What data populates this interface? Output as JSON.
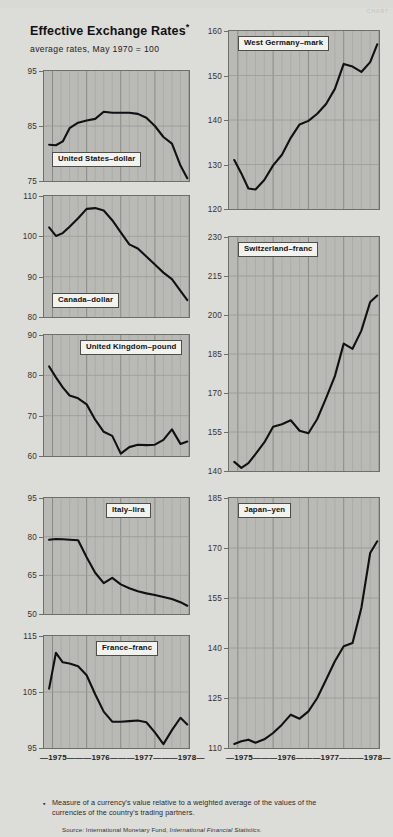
{
  "header": {
    "title": "Effective Exchange Rates",
    "title_asterisk": "*",
    "subtitle": "average rates, May 1970 = 100",
    "watermark": "CHART"
  },
  "footnote": {
    "marker": "▪",
    "text": "Measure of a currency's value relative to a weighted average of the values of the currencies of the country's trading partners.",
    "source_prefix": "Source: International Monetary Fund, ",
    "source_italic": "International Financial Statistics."
  },
  "axis": {
    "x_ticks": [
      "1975",
      "1976",
      "1977",
      "1978"
    ],
    "x_label_row": "—1975———1976———1977———1978—"
  },
  "chart_data": {
    "type": "line",
    "title": "Effective Exchange Rates*",
    "subtitle": "average rates, May 1970 = 100",
    "xlabel": "",
    "ylabel": "Index (May 1970 = 100)",
    "grid": true,
    "legend": "inline panel labels",
    "xlim": [
      1974.75,
      1979.0
    ],
    "x_tick_labels": [
      "1975",
      "1976",
      "1977",
      "1978"
    ],
    "note": "Each panel is a separate currency index; x axis spans 1975 through 1978 with quarterly gridlines.",
    "panels": [
      {
        "name": "United States–dollar",
        "label": "United States–dollar",
        "ylim": [
          75,
          95
        ],
        "yticks": [
          75,
          85,
          95
        ],
        "x": [
          1974.9,
          1975.1,
          1975.3,
          1975.5,
          1975.75,
          1976.0,
          1976.25,
          1976.5,
          1976.75,
          1977.0,
          1977.25,
          1977.5,
          1977.75,
          1978.0,
          1978.25,
          1978.5,
          1978.75,
          1978.95
        ],
        "values": [
          81.6,
          81.5,
          82.2,
          84.6,
          85.6,
          86.0,
          86.3,
          87.6,
          87.4,
          87.4,
          87.4,
          87.2,
          86.5,
          85.0,
          83.0,
          81.8,
          77.8,
          75.5
        ]
      },
      {
        "name": "Canada–dollar",
        "label": "Canada–dollar",
        "ylim": [
          80,
          110
        ],
        "yticks": [
          80,
          90,
          100,
          110
        ],
        "x": [
          1974.9,
          1975.1,
          1975.3,
          1975.5,
          1975.75,
          1976.0,
          1976.25,
          1976.5,
          1976.75,
          1977.0,
          1977.25,
          1977.5,
          1977.75,
          1978.0,
          1978.25,
          1978.5,
          1978.75,
          1978.95
        ],
        "values": [
          102.2,
          100.1,
          100.8,
          102.4,
          104.5,
          106.8,
          107.0,
          106.4,
          104.0,
          101.0,
          98.0,
          97.0,
          95.0,
          93.0,
          91.0,
          89.4,
          86.5,
          84.2
        ]
      },
      {
        "name": "United Kingdom–pound",
        "label": "United Kingdom–pound",
        "ylim": [
          60,
          90
        ],
        "yticks": [
          60,
          70,
          80,
          90
        ],
        "x": [
          1974.9,
          1975.1,
          1975.3,
          1975.5,
          1975.75,
          1976.0,
          1976.25,
          1976.5,
          1976.75,
          1977.0,
          1977.25,
          1977.5,
          1977.75,
          1978.0,
          1978.25,
          1978.5,
          1978.75,
          1978.95
        ],
        "values": [
          82.2,
          79.5,
          77.0,
          75.0,
          74.3,
          72.8,
          69.0,
          66.0,
          65.0,
          60.6,
          62.2,
          62.8,
          62.7,
          62.8,
          64.0,
          66.6,
          63.0,
          63.6
        ]
      },
      {
        "name": "Italy–lira",
        "label": "Italy–lira",
        "ylim": [
          50,
          95
        ],
        "yticks": [
          50,
          65,
          80,
          95
        ],
        "x": [
          1974.9,
          1975.1,
          1975.3,
          1975.5,
          1975.75,
          1976.0,
          1976.25,
          1976.5,
          1976.75,
          1977.0,
          1977.25,
          1977.5,
          1977.75,
          1978.0,
          1978.25,
          1978.5,
          1978.75,
          1978.95
        ],
        "values": [
          78.8,
          79.1,
          79.0,
          78.8,
          78.6,
          72.0,
          66.0,
          62.0,
          64.0,
          61.5,
          60.0,
          58.8,
          58.0,
          57.4,
          56.6,
          55.8,
          54.6,
          53.2
        ]
      },
      {
        "name": "France–franc",
        "label": "France–franc",
        "ylim": [
          95,
          115
        ],
        "yticks": [
          95,
          105,
          115
        ],
        "x": [
          1974.9,
          1975.1,
          1975.3,
          1975.5,
          1975.75,
          1976.0,
          1976.25,
          1976.5,
          1976.75,
          1977.0,
          1977.25,
          1977.5,
          1977.75,
          1978.0,
          1978.25,
          1978.5,
          1978.75,
          1978.95
        ],
        "values": [
          105.6,
          112.0,
          110.3,
          110.1,
          109.6,
          108.0,
          104.6,
          101.5,
          99.7,
          99.7,
          99.8,
          99.9,
          99.6,
          97.8,
          95.7,
          98.2,
          100.4,
          99.2
        ]
      },
      {
        "name": "West Germany–mark",
        "label": "West Germany–mark",
        "ylim": [
          120,
          160
        ],
        "yticks": [
          120,
          130,
          140,
          150,
          160
        ],
        "x": [
          1974.9,
          1975.1,
          1975.3,
          1975.5,
          1975.75,
          1976.0,
          1976.25,
          1976.5,
          1976.75,
          1977.0,
          1977.25,
          1977.5,
          1977.75,
          1978.0,
          1978.25,
          1978.5,
          1978.75,
          1978.95
        ],
        "values": [
          131.0,
          128.0,
          124.6,
          124.4,
          126.5,
          129.8,
          132.2,
          136.0,
          139.0,
          139.8,
          141.4,
          143.6,
          147.0,
          152.6,
          152.0,
          150.8,
          153.0,
          157.0
        ]
      },
      {
        "name": "Switzerland–franc",
        "label": "Switzerland–franc",
        "ylim": [
          140,
          230
        ],
        "yticks": [
          140,
          155,
          170,
          185,
          200,
          215,
          230
        ],
        "x": [
          1974.9,
          1975.1,
          1975.3,
          1975.5,
          1975.75,
          1976.0,
          1976.25,
          1976.5,
          1976.75,
          1977.0,
          1977.25,
          1977.5,
          1977.75,
          1978.0,
          1978.25,
          1978.5,
          1978.75,
          1978.95
        ],
        "values": [
          143.5,
          141.2,
          143.0,
          146.5,
          151.0,
          157.0,
          158.0,
          159.5,
          155.5,
          154.5,
          160.0,
          168.0,
          176.5,
          189.0,
          187.0,
          194.0,
          205.0,
          207.5
        ]
      },
      {
        "name": "Japan–yen",
        "label": "Japan–yen",
        "ylim": [
          110,
          185
        ],
        "yticks": [
          110,
          125,
          140,
          155,
          170,
          185
        ],
        "x": [
          1974.9,
          1975.1,
          1975.3,
          1975.5,
          1975.75,
          1976.0,
          1976.25,
          1976.5,
          1976.75,
          1977.0,
          1977.25,
          1977.5,
          1977.75,
          1978.0,
          1978.25,
          1978.5,
          1978.75,
          1978.95
        ],
        "values": [
          111.2,
          112.0,
          112.5,
          111.6,
          112.6,
          114.5,
          117.0,
          120.0,
          118.8,
          121.0,
          125.0,
          130.5,
          136.0,
          140.5,
          141.5,
          152.0,
          168.5,
          172.0
        ]
      }
    ]
  }
}
